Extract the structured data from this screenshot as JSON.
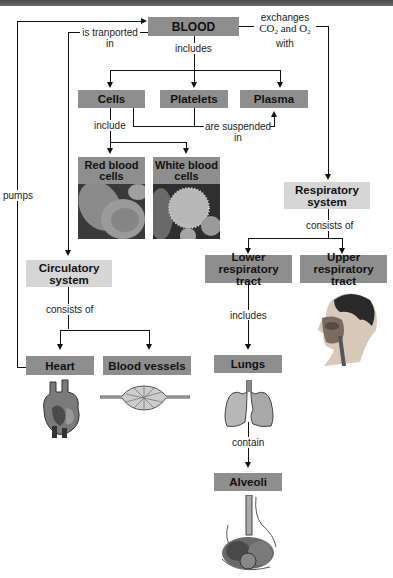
{
  "diagram": {
    "nodes": {
      "blood": "BLOOD",
      "cells": "Cells",
      "platelets": "Platelets",
      "plasma": "Plasma",
      "red_blood_cells": "Red blood cells",
      "white_blood_cells": "White blood cells",
      "respiratory_system": "Respiratory system",
      "circulatory_system": "Circulatory system",
      "lower_respiratory_tract": "Lower respiratory tract",
      "upper_respiratory_tract": "Upper respiratory tract",
      "heart": "Heart",
      "blood_vessels": "Blood vessels",
      "lungs": "Lungs",
      "alveoli": "Alveoli"
    },
    "edges": {
      "is_transported_in_1": "is tranported",
      "is_transported_in_2": "in",
      "exchanges_1": "exchanges",
      "exchanges_co2": "CO",
      "exchanges_and": " and O",
      "exchanges_sub": "2",
      "exchanges_3": "with",
      "includes_blood": "includes",
      "include_cells": "include",
      "are_suspended_1": "are suspended",
      "are_suspended_2": "in",
      "pumps": "pumps",
      "consists_of_resp": "consists of",
      "consists_of_circ": "consists of",
      "includes_lower": "includes",
      "contain": "contain"
    },
    "colors": {
      "dark_box": "#8e8e8e",
      "light_box": "#d6d6d6",
      "line": "#111111"
    }
  }
}
